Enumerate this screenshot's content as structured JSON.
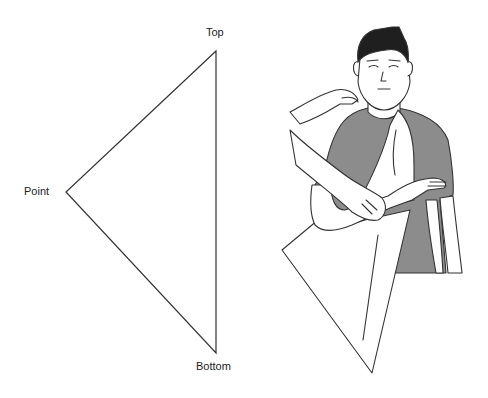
{
  "diagram": {
    "bandage_labels": {
      "top": "Top",
      "point": "Point",
      "bottom": "Bottom"
    },
    "illustration": "Person supporting injured arm while triangular bandage is placed under it",
    "colors": {
      "line": "#333333",
      "shirt": "#8c8c8c",
      "hair": "#1f1f1f",
      "skin": "#ffffff"
    }
  }
}
